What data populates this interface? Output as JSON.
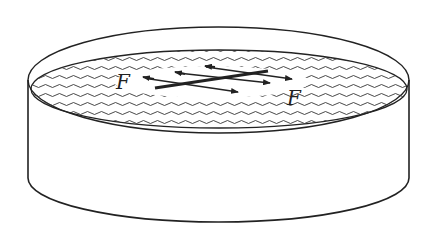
{
  "diagram": {
    "labels": {
      "force_left": "F",
      "force_right": "F"
    },
    "colors": {
      "ink": "#222222",
      "background": "#ffffff"
    }
  }
}
